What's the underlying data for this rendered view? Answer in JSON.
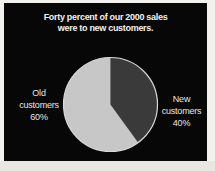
{
  "panel": {
    "background": "#070707",
    "border_color": "#f2f1ed"
  },
  "title": {
    "line1": "Forty percent of our 2000 sales",
    "line2": "were to new customers.",
    "color": "#f2f2f2"
  },
  "labels": {
    "old": [
      "Old",
      "customers",
      "60%"
    ],
    "new": [
      "New",
      "customers",
      "40%"
    ],
    "color": "#e6e6e6"
  },
  "chart_data": {
    "type": "pie",
    "title": "Forty percent of our 2000 sales were to new customers.",
    "slices": [
      {
        "label": "New customers",
        "value": 40,
        "color": "#3a3a3a"
      },
      {
        "label": "Old customers",
        "value": 60,
        "color": "#c7c7c7"
      }
    ],
    "start_angle": "12 o'clock",
    "direction": "clockwise",
    "rim_color": "#d9d9d9",
    "legend_position": "sides"
  }
}
